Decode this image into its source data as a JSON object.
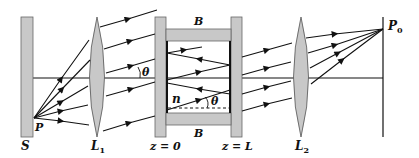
{
  "diagram": {
    "colors": {
      "component_fill": "#c8c8c8",
      "stroke": "#111111",
      "background": "#ffffff"
    },
    "labels": {
      "screen_s": "S",
      "lens_1": "L",
      "lens_1_sub": "1",
      "lens_2": "L",
      "lens_2_sub": "2",
      "plate_left": "z = 0",
      "plate_right": "z = L",
      "block_top": "B",
      "block_bottom": "B",
      "source_point": "P",
      "focus_point": "P",
      "focus_point_sub": "0",
      "angle_outside": "θ",
      "angle_inside": "θ",
      "medium_index": "n"
    }
  }
}
